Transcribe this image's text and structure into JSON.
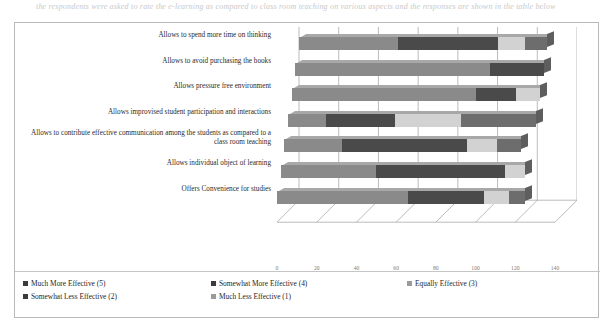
{
  "page": {
    "top_fragment": "the respondents were asked to rate the e-learning as compared to class room teaching on various aspects and the responses are shown in the table below"
  },
  "chart_data": {
    "type": "bar",
    "orientation": "horizontal",
    "stacked": true,
    "title": "",
    "xlabel": "",
    "ylabel": "",
    "xlim": [
      0,
      140
    ],
    "xticks": [
      0,
      20,
      40,
      60,
      80,
      100,
      120,
      140
    ],
    "grid": true,
    "legend_position": "bottom",
    "categories": [
      "Allows to spend more time on thinking",
      "Allows to avoid purchasing the books",
      "Allows pressure free environment",
      "Allows improvised student participation and interactions",
      "Allows to contribute effective communication among the students as compared to a class room teaching",
      "Allows individual object of learning",
      "Offers Convenience for studies"
    ],
    "series": [
      {
        "name": "Much More Effective (5)",
        "key": "s5",
        "color": "#8a8a8a",
        "values": [
          50,
          98,
          93,
          19,
          29,
          48,
          66
        ]
      },
      {
        "name": "Somewhat More Effective (4)",
        "key": "s4",
        "color": "#4a4a4a",
        "values": [
          50,
          27,
          20,
          35,
          63,
          65,
          38
        ]
      },
      {
        "name": "Equally Effective (3)",
        "key": "s3",
        "color": "#d2d2d2",
        "values": [
          14,
          0,
          12,
          33,
          15,
          10,
          13
        ]
      },
      {
        "name": "Somewhat Less Effective (2)",
        "key": "s2",
        "color": "#6d6d6d",
        "values": [
          11,
          0,
          0,
          38,
          12,
          0,
          8
        ]
      },
      {
        "name": "Much Less Effective (1)",
        "key": "s1",
        "color": "#3a3a3a",
        "values": [
          0,
          0,
          0,
          0,
          0,
          0,
          0
        ]
      }
    ]
  },
  "legend": {
    "items": [
      {
        "label": "Much More Effective (5)",
        "swatch": "sw5"
      },
      {
        "label": "Somewhat More Effective (4)",
        "swatch": "sw4"
      },
      {
        "label": "Equally Effective (3)",
        "swatch": "sw3"
      },
      {
        "label": "Somewhat Less Effective (2)",
        "swatch": "sw2"
      },
      {
        "label": "Much Less Effective (1)",
        "swatch": "sw1"
      }
    ]
  }
}
